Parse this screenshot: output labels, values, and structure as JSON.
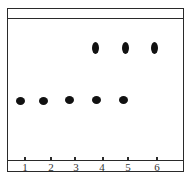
{
  "diagram": {
    "type": "thin-layer chromatography plate",
    "colors": {
      "line": "#2a2a2a",
      "spot": "#111111",
      "background": "#ffffff"
    },
    "lanes": [
      {
        "label": "1",
        "x": 25
      },
      {
        "label": "2",
        "x": 51
      },
      {
        "label": "3",
        "x": 76
      },
      {
        "label": "4",
        "x": 102
      },
      {
        "label": "5",
        "x": 128
      },
      {
        "label": "6",
        "x": 157
      }
    ],
    "lower_spots": [
      {
        "lane": "1"
      },
      {
        "lane": "2"
      },
      {
        "lane": "3"
      },
      {
        "lane": "4"
      },
      {
        "lane": "5"
      }
    ],
    "upper_spots": [
      {
        "lane": "4"
      },
      {
        "lane": "5"
      },
      {
        "lane": "6"
      }
    ]
  }
}
